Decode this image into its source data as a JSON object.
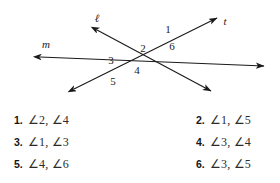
{
  "figure": {
    "caption": "Two lines cut by a transversal forming six numbered angles",
    "line_labels": [
      {
        "name": "line-label-l",
        "text": "ℓ",
        "x": 97,
        "y": 22
      },
      {
        "name": "line-label-m",
        "text": "m",
        "x": 46,
        "y": 48
      },
      {
        "name": "line-label-t",
        "text": "t",
        "x": 225,
        "y": 25
      }
    ],
    "angle_labels": [
      {
        "name": "angle-label-1",
        "text": "1",
        "x": 168,
        "y": 33
      },
      {
        "name": "angle-label-2",
        "text": "2",
        "x": 143,
        "y": 52
      },
      {
        "name": "angle-label-3",
        "text": "3",
        "x": 111,
        "y": 64
      },
      {
        "name": "angle-label-4",
        "text": "4",
        "x": 137,
        "y": 74
      },
      {
        "name": "angle-label-5",
        "text": "5",
        "x": 113,
        "y": 85
      },
      {
        "name": "angle-label-6",
        "text": "6",
        "x": 172,
        "y": 50
      }
    ],
    "stroke_color": "#1a1a1a"
  },
  "exercises": {
    "rows": [
      {
        "left": {
          "number": "1.",
          "text": "∠2, ∠4"
        },
        "right": {
          "number": "2.",
          "text": "∠1, ∠5"
        }
      },
      {
        "left": {
          "number": "3.",
          "text": "∠1, ∠3"
        },
        "right": {
          "number": "4.",
          "text": "∠3, ∠4"
        }
      },
      {
        "left": {
          "number": "5.",
          "text": "∠4, ∠6"
        },
        "right": {
          "number": "6.",
          "text": "∠3, ∠5"
        }
      }
    ]
  }
}
